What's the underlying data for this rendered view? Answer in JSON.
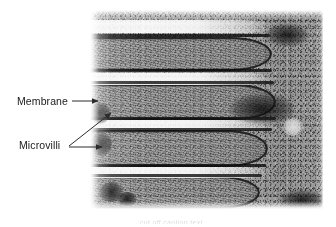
{
  "figure": {
    "type": "electron-micrograph",
    "subject": "Microvilli",
    "background_color": "#ffffff"
  },
  "annotations": {
    "membrane": {
      "label": "Membrane",
      "leader": "single-arrow-right"
    },
    "microvilli": {
      "label": "Microvilli",
      "leader": "double-arrow"
    }
  },
  "caption": {
    "remnant_text": "cut off caption text"
  },
  "colors": {
    "label_text": "#1a1a1a",
    "leader_line": "#2b2b2b",
    "plate_light": "#e8e8e8",
    "plate_mid": "#9a9a9a",
    "plate_dark": "#1b1b1b"
  },
  "micrograph_structure": {
    "villi": [
      {
        "top": 27,
        "height": 34,
        "length": 182
      },
      {
        "top": 74,
        "height": 36,
        "length": 186
      },
      {
        "top": 120,
        "height": 37,
        "length": 178
      },
      {
        "top": 166,
        "height": 33,
        "length": 170
      }
    ],
    "gaps": [
      {
        "top": 63,
        "height": 12,
        "length": 186
      },
      {
        "top": 110,
        "height": 10,
        "length": 190
      },
      {
        "top": 157,
        "height": 11,
        "length": 182
      }
    ]
  }
}
